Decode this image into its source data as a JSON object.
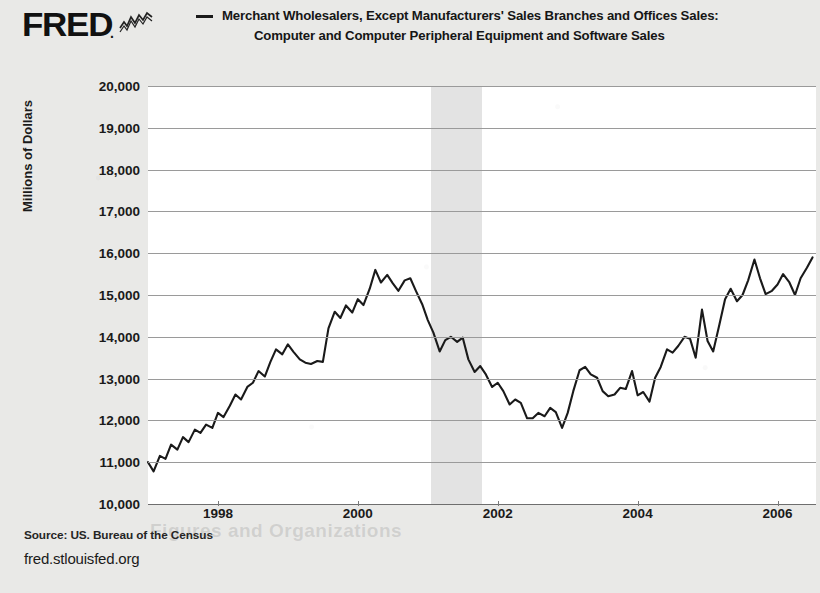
{
  "brand": {
    "logo_text": "FRED",
    "logo_dot": ".",
    "spark_icon": "line-chart-icon"
  },
  "legend": {
    "marker": "line-swatch",
    "line1": "Merchant Wholesalers, Except Manufacturers' Sales Branches and Offices Sales:",
    "line2": "Computer and Computer Peripheral Equipment and Software Sales"
  },
  "footer": {
    "source": "Source: US. Bureau of the Census",
    "url": "fred.stlouisfed.org",
    "ghost": "Figures and Organizations"
  },
  "colors": {
    "page_background": "#e9e9e7",
    "plot_background": "#ffffff",
    "series_line": "#1a1a1a",
    "gridline": "#9a9a9a",
    "recession_band": "#e3e3e3",
    "text": "#1a1a1a"
  },
  "chart_data": {
    "type": "line",
    "title": "Merchant Wholesalers, Except Manufacturers' Sales Branches and Offices Sales: Computer and Computer Peripheral Equipment and Software Sales",
    "xlabel": "",
    "ylabel": "Millions of Dollars",
    "ylim": [
      10000,
      20000
    ],
    "ytick_step": 1000,
    "ytick_labels": [
      "20,000",
      "19,000",
      "18,000",
      "17,000",
      "16,000",
      "15,000",
      "14,000",
      "13,000",
      "12,000",
      "11,000",
      "10,000"
    ],
    "ytick_values": [
      20000,
      19000,
      18000,
      17000,
      16000,
      15000,
      14000,
      13000,
      12000,
      11000,
      10000
    ],
    "xlim": [
      1997.0,
      2006.55
    ],
    "xtick_labels": [
      "1998",
      "2000",
      "2002",
      "2004",
      "2006"
    ],
    "xtick_values": [
      1998,
      2000,
      2002,
      2004,
      2006
    ],
    "grid": true,
    "legend_position": "top",
    "shaded_regions": [
      {
        "label": "recession",
        "start": 2001.05,
        "end": 2001.78,
        "color": "#e3e3e3"
      }
    ],
    "series": [
      {
        "name": "Computer and Computer Peripheral Equipment and Software Sales",
        "color": "#1a1a1a",
        "x": [
          1997.0,
          1997.08,
          1997.17,
          1997.25,
          1997.33,
          1997.42,
          1997.5,
          1997.58,
          1997.67,
          1997.75,
          1997.83,
          1997.92,
          1998.0,
          1998.08,
          1998.17,
          1998.25,
          1998.33,
          1998.42,
          1998.5,
          1998.58,
          1998.67,
          1998.75,
          1998.83,
          1998.92,
          1999.0,
          1999.08,
          1999.17,
          1999.25,
          1999.33,
          1999.42,
          1999.5,
          1999.58,
          1999.67,
          1999.75,
          1999.83,
          1999.92,
          2000.0,
          2000.08,
          2000.17,
          2000.25,
          2000.33,
          2000.42,
          2000.5,
          2000.58,
          2000.67,
          2000.75,
          2000.83,
          2000.92,
          2001.0,
          2001.08,
          2001.17,
          2001.25,
          2001.33,
          2001.42,
          2001.5,
          2001.58,
          2001.67,
          2001.75,
          2001.83,
          2001.92,
          2002.0,
          2002.08,
          2002.17,
          2002.25,
          2002.33,
          2002.42,
          2002.5,
          2002.58,
          2002.67,
          2002.75,
          2002.83,
          2002.92,
          2003.0,
          2003.08,
          2003.17,
          2003.25,
          2003.33,
          2003.42,
          2003.5,
          2003.58,
          2003.67,
          2003.75,
          2003.83,
          2003.92,
          2004.0,
          2004.08,
          2004.17,
          2004.25,
          2004.33,
          2004.42,
          2004.5,
          2004.58,
          2004.67,
          2004.75,
          2004.83,
          2004.92,
          2005.0,
          2005.08,
          2005.17,
          2005.25,
          2005.33,
          2005.42,
          2005.5,
          2005.58,
          2005.67,
          2005.75,
          2005.83,
          2005.92,
          2006.0,
          2006.08,
          2006.17,
          2006.25,
          2006.33,
          2006.42,
          2006.5
        ],
        "values": [
          11000,
          10780,
          11150,
          11080,
          11420,
          11300,
          11600,
          11480,
          11780,
          11700,
          11900,
          11820,
          12180,
          12080,
          12350,
          12620,
          12500,
          12800,
          12900,
          13180,
          13050,
          13400,
          13700,
          13580,
          13820,
          13640,
          13460,
          13380,
          13350,
          13420,
          13400,
          14200,
          14600,
          14450,
          14750,
          14580,
          14900,
          14760,
          15150,
          15600,
          15300,
          15480,
          15280,
          15100,
          15350,
          15400,
          15100,
          14780,
          14400,
          14100,
          13650,
          13920,
          14000,
          13880,
          13980,
          13460,
          13160,
          13300,
          13100,
          12800,
          12900,
          12700,
          12380,
          12500,
          12420,
          12050,
          12050,
          12180,
          12100,
          12300,
          12200,
          11820,
          12180,
          12700,
          13200,
          13280,
          13100,
          13020,
          12700,
          12580,
          12620,
          12780,
          12750,
          13180,
          12600,
          12680,
          12450,
          13020,
          13280,
          13700,
          13620,
          13780,
          14000,
          13950,
          13500,
          14650,
          13900,
          13650,
          14300,
          14900,
          15150,
          14850,
          15000,
          15350,
          15850,
          15400,
          15020,
          15100,
          15250,
          15500,
          15300,
          15000,
          15400,
          15650,
          15900
        ]
      }
    ]
  }
}
